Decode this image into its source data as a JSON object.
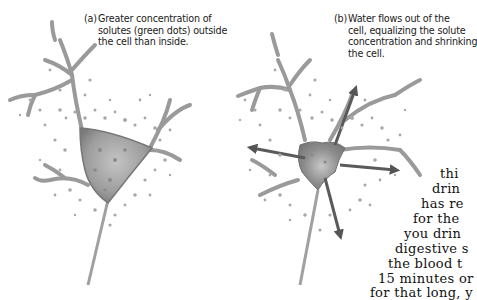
{
  "figure": {
    "panel_a": {
      "label": "(a)",
      "caption_lines": [
        "Greater concentration of",
        "solutes (green dots) outside",
        "the cell than inside."
      ]
    },
    "panel_b": {
      "label": "(b)",
      "caption_lines": [
        "Water flows out of the",
        "cell, equalizing the solute",
        "concentration and shrinking",
        "the cell."
      ]
    },
    "colors": {
      "cell_fill": "#9a9a9a",
      "cell_edge": "#6e6e6e",
      "dots": "#a8a8a8",
      "arrows": "#5a5a5a",
      "text": "#1a1a1a"
    }
  },
  "body_text": {
    "lines": [
      "thi",
      "drin",
      "has re",
      "for the",
      "you drin",
      "digestive s",
      "the blood t",
      "15 minutes or",
      "for that long, y"
    ]
  }
}
